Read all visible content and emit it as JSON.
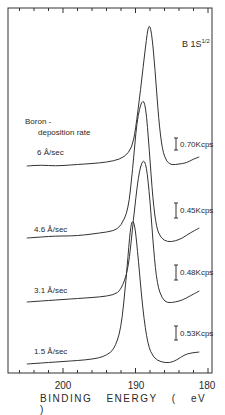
{
  "chart_data": {
    "type": "line",
    "title_main": "B 1S",
    "title_sup": "1/2",
    "xlabel": "BINDING   ENERGY   ( eV )",
    "ylabel": "",
    "x_ticks": [
      200,
      190,
      180
    ],
    "xlim": [
      207.5,
      179.3
    ],
    "x_inverted": true,
    "grid": false,
    "legend_title": "Boron - deposition rate",
    "legend_title_line1": "Boron -",
    "legend_title_line2": "deposition rate",
    "series": [
      {
        "name": "6 Å/sec",
        "peak_eV": 188.2,
        "scale_bar": "0.70Kcps",
        "points": [
          [
            205,
            166
          ],
          [
            203,
            165
          ],
          [
            201,
            166
          ],
          [
            199,
            165
          ],
          [
            197,
            164
          ],
          [
            195,
            163
          ],
          [
            193,
            161
          ],
          [
            191.5,
            157
          ],
          [
            190.5,
            148
          ],
          [
            190,
            130
          ],
          [
            189.3,
            90
          ],
          [
            188.6,
            45
          ],
          [
            188.2,
            24
          ],
          [
            187.8,
            30
          ],
          [
            187.3,
            70
          ],
          [
            186.8,
            120
          ],
          [
            186.3,
            150
          ],
          [
            185.7,
            162
          ],
          [
            185,
            165
          ],
          [
            184,
            164
          ],
          [
            183,
            163
          ],
          [
            182,
            159
          ],
          [
            181.2,
            157
          ]
        ]
      },
      {
        "name": "4.6 Å/sec",
        "peak_eV": 189.1,
        "scale_bar": "0.45Kcps",
        "points": [
          [
            205,
            238
          ],
          [
            203,
            237
          ],
          [
            201,
            236
          ],
          [
            199,
            236
          ],
          [
            197,
            235
          ],
          [
            195,
            233
          ],
          [
            193,
            231
          ],
          [
            192,
            226
          ],
          [
            191,
            210
          ],
          [
            190.4,
            170
          ],
          [
            189.8,
            120
          ],
          [
            189.1,
            99
          ],
          [
            188.6,
            105
          ],
          [
            188.1,
            150
          ],
          [
            187.6,
            200
          ],
          [
            187.1,
            228
          ],
          [
            186.5,
            238
          ],
          [
            185.6,
            242
          ],
          [
            184.5,
            241
          ],
          [
            183.5,
            238
          ],
          [
            182.5,
            233
          ],
          [
            181.2,
            228
          ]
        ]
      },
      {
        "name": "3.1 Å/sec",
        "peak_eV": 189.0,
        "scale_bar": "0.48Kcps",
        "points": [
          [
            205,
            302
          ],
          [
            203,
            301
          ],
          [
            201,
            300
          ],
          [
            199,
            299
          ],
          [
            197,
            298
          ],
          [
            195,
            297
          ],
          [
            193,
            295
          ],
          [
            192,
            290
          ],
          [
            191,
            270
          ],
          [
            190.3,
            220
          ],
          [
            189.6,
            175
          ],
          [
            189,
            159
          ],
          [
            188.5,
            165
          ],
          [
            188,
            200
          ],
          [
            187.5,
            250
          ],
          [
            187,
            285
          ],
          [
            186.3,
            299
          ],
          [
            185.6,
            303
          ],
          [
            184.5,
            302
          ],
          [
            183.5,
            300
          ],
          [
            182.5,
            296
          ],
          [
            181.2,
            291
          ]
        ]
      },
      {
        "name": "1.5 Å/sec",
        "peak_eV": 190.5,
        "scale_bar": "0.53Kcps",
        "points": [
          [
            205,
            364
          ],
          [
            203,
            363
          ],
          [
            201,
            362
          ],
          [
            199,
            361
          ],
          [
            197,
            360
          ],
          [
            195,
            358
          ],
          [
            194,
            355
          ],
          [
            193,
            350
          ],
          [
            192,
            330
          ],
          [
            191.3,
            280
          ],
          [
            190.8,
            235
          ],
          [
            190.5,
            220
          ],
          [
            190.1,
            224
          ],
          [
            189.6,
            260
          ],
          [
            189,
            310
          ],
          [
            188.3,
            345
          ],
          [
            187.5,
            358
          ],
          [
            186.5,
            362
          ],
          [
            185.3,
            363
          ],
          [
            184.3,
            360
          ],
          [
            183.3,
            355
          ],
          [
            182.4,
            353
          ],
          [
            181.2,
            352
          ]
        ]
      }
    ],
    "scale_bars": [
      "0.70Kcps",
      "0.45Kcps",
      "0.48Kcps",
      "0.53Kcps"
    ]
  },
  "labels": {
    "legend_line1": "Boron -",
    "legend_line2": "deposition rate",
    "rate_1": "6  Å/sec",
    "rate_2": "4.6 Å/sec",
    "rate_3": "3.1 Å/sec",
    "rate_4": "1.5 Å/sec",
    "scale_1": "0.70Kcps",
    "scale_2": "0.45Kcps",
    "scale_3": "0.48Kcps",
    "scale_4": "0.53Kcps",
    "tick_200": "200",
    "tick_190": "190",
    "tick_180": "180",
    "xlabel": "BINDING ENERGY ( eV )",
    "title_main": "B 1S",
    "title_sup": "1/2"
  }
}
